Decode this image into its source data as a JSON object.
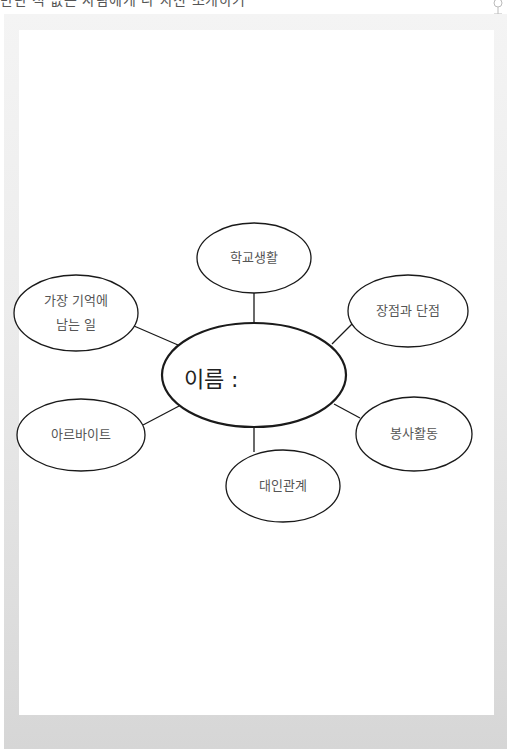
{
  "page": {
    "top_caption_clipped": "만난 적 없는 사람에게 나 자신 소개하기",
    "frame_colors": {
      "frame_top": "#f4f4f4",
      "frame_bottom": "#d6d6d6",
      "panel": "#ffffff",
      "stroke": "#1a1a1a",
      "label_text": "#555555"
    }
  },
  "mindmap": {
    "center": {
      "label": "이름 :"
    },
    "nodes": [
      {
        "id": "school-life",
        "label": "학교생활"
      },
      {
        "id": "memorable",
        "label_line1": "가장 기억에",
        "label_line2": "남는 일"
      },
      {
        "id": "pros-cons",
        "label": "장점과 단점"
      },
      {
        "id": "part-time",
        "label": "아르바이트"
      },
      {
        "id": "volunteer",
        "label": "봉사활동"
      },
      {
        "id": "relationships",
        "label": "대인관계"
      }
    ]
  },
  "icons": {
    "corner": "pin-icon"
  }
}
